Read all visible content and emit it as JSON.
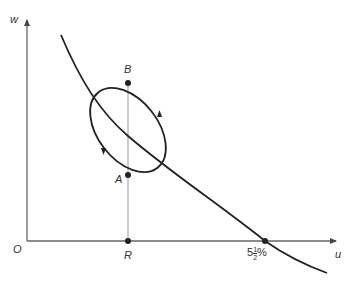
{
  "diagram": {
    "type": "phase-diagram",
    "axes": {
      "x_label": "u",
      "y_label": "w",
      "origin_label": "O"
    },
    "curve": {
      "description": "downward-sloping curve crossing u-axis"
    },
    "cycle": {
      "description": "elliptical cycle around the curve",
      "direction": "counterclockwise",
      "arrows": 2
    },
    "points": [
      {
        "label": "B",
        "position": "top of cycle on vertical line"
      },
      {
        "label": "A",
        "position": "bottom of cycle on vertical line"
      },
      {
        "label": "R",
        "position": "on u-axis below A and B"
      }
    ],
    "x_intercept": {
      "whole": "5",
      "num": "1",
      "den": "2",
      "unit": "%"
    },
    "colors": {
      "curve": "#222222",
      "axis": "#555555",
      "guide": "#888888"
    }
  }
}
